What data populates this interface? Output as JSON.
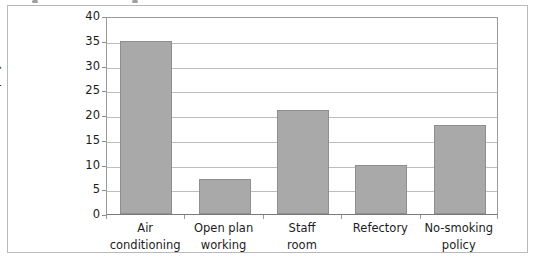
{
  "chart_data": {
    "type": "bar",
    "title": "",
    "xlabel": "",
    "ylabel": "Number of employees",
    "ylim": [
      0,
      40
    ],
    "ytick_step": 5,
    "yticks": [
      40,
      35,
      30,
      25,
      20,
      15,
      10,
      5,
      0
    ],
    "grid": true,
    "legend": "none",
    "categories": [
      "Air conditioning",
      "Open plan working",
      "Staff room",
      "Refectory",
      "No-smoking policy"
    ],
    "category_lines": [
      [
        "Air",
        "conditioning"
      ],
      [
        "Open plan",
        "working"
      ],
      [
        "Staff",
        "room"
      ],
      [
        "Refectory",
        ""
      ],
      [
        "No-smoking",
        "policy"
      ]
    ],
    "values": [
      35,
      7,
      21,
      10,
      18
    ],
    "bar_fill": "#a9a9a9",
    "bar_stroke": "#8e8e8e",
    "gridline_color": "#bdbdbd",
    "axis_color": "#9b9b9b",
    "frame_color": "#b9b9b9",
    "background": "#ffffff",
    "text_color": "#1c1c1c"
  }
}
